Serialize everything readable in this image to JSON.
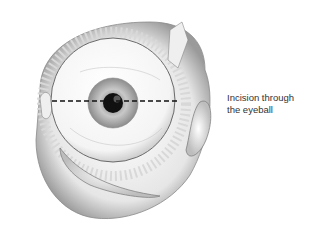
{
  "figure": {
    "subject": "eyeball",
    "annotation": {
      "line1": "Incision through",
      "line2": "the eyeball"
    },
    "colors": {
      "background": "#ffffff",
      "line": "#111111",
      "text": "#333333",
      "pupil": "#111111"
    }
  }
}
